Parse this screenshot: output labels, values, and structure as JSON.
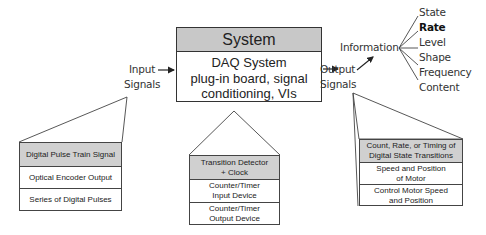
{
  "system": {
    "title": "System",
    "body_lines": [
      "DAQ System",
      "plug-in board, signal",
      "conditioning, VIs"
    ]
  },
  "input": {
    "label_lines": [
      "Input",
      "Signals"
    ],
    "stack": [
      {
        "text": "Digital Pulse Train Signal",
        "highlighted": true
      },
      {
        "text": "Optical Encoder Output",
        "highlighted": false
      },
      {
        "text": "Series of Digital Pulses",
        "highlighted": false
      }
    ]
  },
  "system_stack": [
    {
      "lines": [
        "Transition Detector",
        "+ Clock"
      ],
      "highlighted": true
    },
    {
      "lines": [
        "Counter/Timer",
        "Input Device"
      ],
      "highlighted": false
    },
    {
      "lines": [
        "Counter/Timer",
        "Output Device"
      ],
      "highlighted": false
    }
  ],
  "output": {
    "label_lines": [
      "Output",
      "Signals"
    ],
    "stack": [
      {
        "lines": [
          "Count, Rate, or Timing of",
          "Digital State Transitions"
        ],
        "highlighted": true
      },
      {
        "lines": [
          "Speed and Position",
          "of Motor"
        ],
        "highlighted": false
      },
      {
        "lines": [
          "Control Motor Speed",
          "and Position"
        ],
        "highlighted": false
      }
    ]
  },
  "information": {
    "label": "Information",
    "items": [
      {
        "text": "State",
        "bold": false
      },
      {
        "text": "Rate",
        "bold": true
      },
      {
        "text": "Level",
        "bold": false
      },
      {
        "text": "Shape",
        "bold": false
      },
      {
        "text": "Frequency",
        "bold": false
      },
      {
        "text": "Content",
        "bold": false
      }
    ]
  },
  "colors": {
    "header_fill": "#c8c8c8",
    "highlight_fill": "#d0d0d0",
    "line": "#333333"
  }
}
